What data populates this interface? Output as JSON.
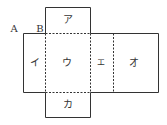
{
  "diagram": {
    "type": "box-net",
    "points": {
      "A": "A",
      "B": "B"
    },
    "faces": {
      "a": "ア",
      "i": "イ",
      "u": "ウ",
      "e": "エ",
      "o": "オ",
      "ka": "カ"
    },
    "colors": {
      "line": "#333333",
      "background": "#ffffff"
    }
  }
}
